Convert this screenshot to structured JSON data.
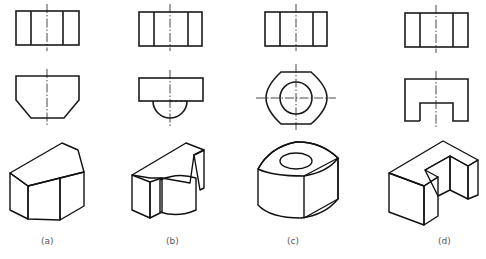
{
  "figure": {
    "panels": [
      {
        "id": "a",
        "label": "(a)",
        "front_view": "rectangle divided by two vertical lines",
        "top_view": "trapezoid-bottom hexagon (chamfered lower corners)",
        "solid": "prism with chamfered faces"
      },
      {
        "id": "b",
        "label": "(b)",
        "front_view": "rectangle divided by two vertical lines",
        "top_view": "rectangle with semicircle below",
        "solid": "block with half-cylinder boss"
      },
      {
        "id": "c",
        "label": "(c)",
        "front_view": "rectangle divided by two vertical lines",
        "top_view": "octagon-flat circle with concentric hole",
        "solid": "ring with flattened sides"
      },
      {
        "id": "d",
        "label": "(d)",
        "front_view": "rectangle divided by two vertical lines",
        "top_view": "rectangle with rectangular notch at bottom",
        "solid": "U-shaped notched block"
      }
    ]
  },
  "colors": {
    "line": "#1a1a1a",
    "shade_dark": "#3a3a3a",
    "shade_light": "#f2f2f2",
    "label": "#555555"
  }
}
